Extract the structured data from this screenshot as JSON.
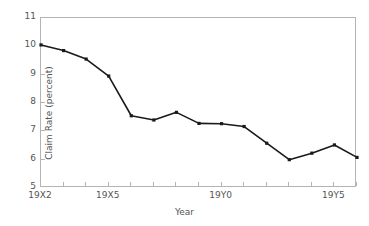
{
  "chart_data": {
    "type": "line",
    "title": "",
    "xlabel": "Year",
    "ylabel": "Claim Rate (percent)",
    "ylim": [
      5,
      11
    ],
    "yticks": [
      5,
      6,
      7,
      8,
      9,
      10,
      11
    ],
    "ytick_labels": [
      "5",
      "6",
      "7",
      "8",
      "9",
      "10",
      "11"
    ],
    "grid": false,
    "legend": "none",
    "x_index": [
      0,
      1,
      2,
      3,
      4,
      5,
      6,
      7,
      8,
      9,
      10,
      11,
      12,
      13,
      14
    ],
    "x_tick_positions": [
      0,
      1,
      2,
      3,
      4,
      5,
      6,
      7,
      8,
      9,
      10,
      11,
      12,
      13,
      14
    ],
    "xtick_labels": [
      {
        "index": 0,
        "label": "19X2"
      },
      {
        "index": 3,
        "label": "19X5"
      },
      {
        "index": 8,
        "label": "19Y0"
      },
      {
        "index": 13,
        "label": "19Y5"
      }
    ],
    "categories": [
      "19X2",
      "19X3",
      "19X4",
      "19X5",
      "19X6",
      "19X7",
      "19X8",
      "19X9",
      "19Y0",
      "19Y1",
      "19Y2",
      "19Y3",
      "19Y4",
      "19Y5",
      "19Y6"
    ],
    "values": [
      10.05,
      9.85,
      9.55,
      8.95,
      7.55,
      7.4,
      7.67,
      7.28,
      7.27,
      7.17,
      6.58,
      6.0,
      6.23,
      6.52,
      6.08
    ],
    "series": [
      {
        "name": "Claim Rate",
        "values": [
          10.05,
          9.85,
          9.55,
          8.95,
          7.55,
          7.4,
          7.67,
          7.28,
          7.27,
          7.17,
          6.58,
          6.0,
          6.23,
          6.52,
          6.08
        ]
      }
    ],
    "colors": {
      "line": "#1a1a1a",
      "marker": "#1a1a1a",
      "frame": "#b4b4b4",
      "text": "#555555",
      "background": "#ffffff"
    }
  }
}
